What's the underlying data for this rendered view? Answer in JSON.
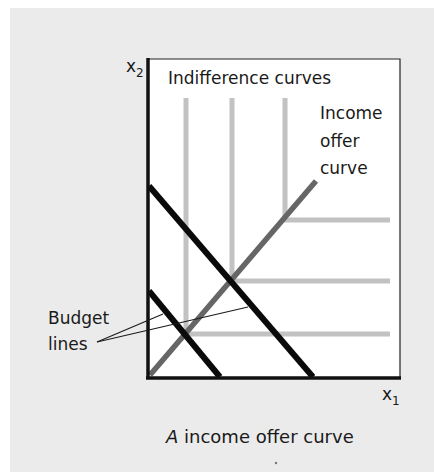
{
  "figure": {
    "caption_italic": "A",
    "caption_rest": " income offer curve",
    "axes": {
      "y_label_base": "x",
      "y_label_sub": "2",
      "x_label_base": "x",
      "x_label_sub": "1"
    },
    "labels": {
      "indifference_curves": "Indifference curves",
      "income_offer_line1": "Income",
      "income_offer_line2": "offer",
      "income_offer_line3": "curve",
      "budget_line1": "Budget",
      "budget_line2": "lines"
    },
    "colors": {
      "background_panel": "#ebebeb",
      "plot_area": "#ffffff",
      "axes": "#111111",
      "budget_lines": "#0a0a0a",
      "indifference_curves": "#c2c2c2",
      "income_offer_curve": "#666666",
      "text": "#1a1a1a"
    },
    "elements": {
      "indifference_curves": [
        {
          "type": "perfect-complements-L",
          "corner": [
            186,
            334
          ]
        },
        {
          "type": "perfect-complements-L",
          "corner": [
            232,
            281
          ]
        },
        {
          "type": "perfect-complements-L",
          "corner": [
            285,
            220
          ]
        }
      ],
      "budget_lines": [
        {
          "name": "inner",
          "y_intercept": [
            149,
            290
          ],
          "x_intercept": [
            220,
            377
          ]
        },
        {
          "name": "outer",
          "y_intercept": [
            149,
            185
          ],
          "x_intercept": [
            313,
            377
          ]
        }
      ],
      "income_offer_curve": {
        "from": [
          149,
          376
        ],
        "to": [
          316,
          180
        ]
      }
    }
  }
}
